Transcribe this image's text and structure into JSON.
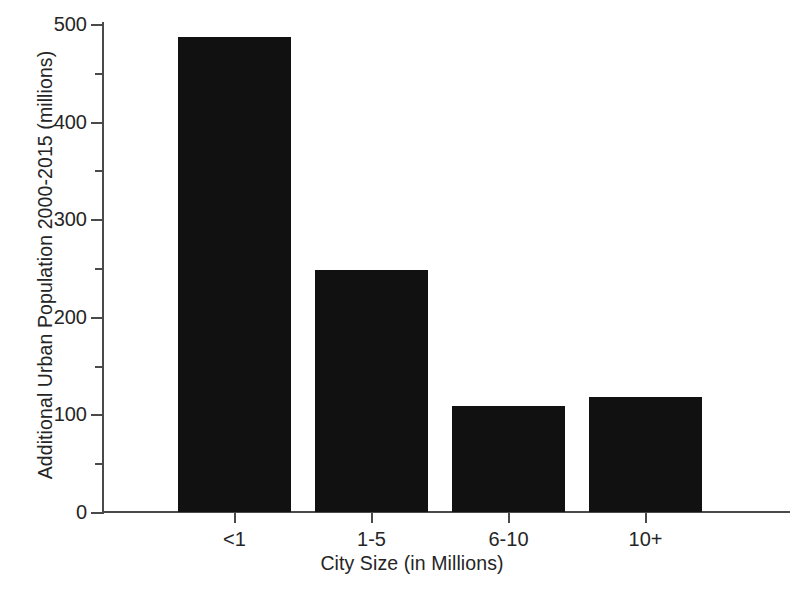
{
  "chart_data": {
    "type": "bar",
    "title": "",
    "categories": [
      "<1",
      "1-5",
      "6-10",
      "10+"
    ],
    "values": [
      487,
      248,
      109,
      118
    ],
    "xlabel": "City Size (in Millions)",
    "ylabel": "Additional Urban Population 2000-2015 (millions)",
    "ylim": [
      0,
      500
    ],
    "y_major_ticks": [
      0,
      100,
      200,
      300,
      400,
      500
    ],
    "y_minor_ticks": [
      50,
      150,
      250,
      350,
      450
    ],
    "y_tick_labels": [
      "0",
      "100",
      "200",
      "300",
      "400",
      "500"
    ],
    "grid": false,
    "legend": null,
    "bar_color": "#111111",
    "axis_color": "#4a4a4a",
    "background": "#ffffff"
  }
}
